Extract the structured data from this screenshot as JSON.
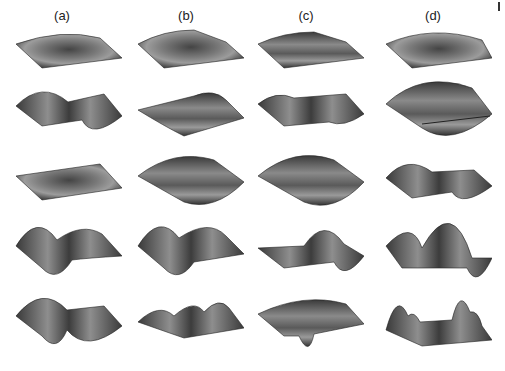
{
  "figure": {
    "columns": [
      {
        "label": "(a)"
      },
      {
        "label": "(b)"
      },
      {
        "label": "(c)"
      },
      {
        "label": "(d)"
      }
    ],
    "rows": 5,
    "colors": {
      "surface_dark": "#2e2e2e",
      "surface_mid": "#6a6a6a",
      "surface_light": "#a8a8a8",
      "background": "#ffffff"
    }
  }
}
